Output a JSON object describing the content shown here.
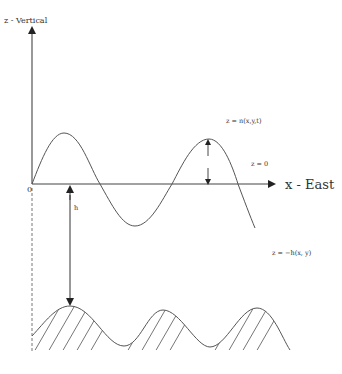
{
  "figure": {
    "title": "",
    "axes": {
      "vertical_label": "z - Vertical",
      "horizontal_label": "x - East",
      "origin_label": "0"
    },
    "annotations": {
      "free_surface": "z = n(x,y,t)",
      "mean_level": "z = 0",
      "bed": "z = −h(x, y)",
      "depth": "h"
    }
  }
}
